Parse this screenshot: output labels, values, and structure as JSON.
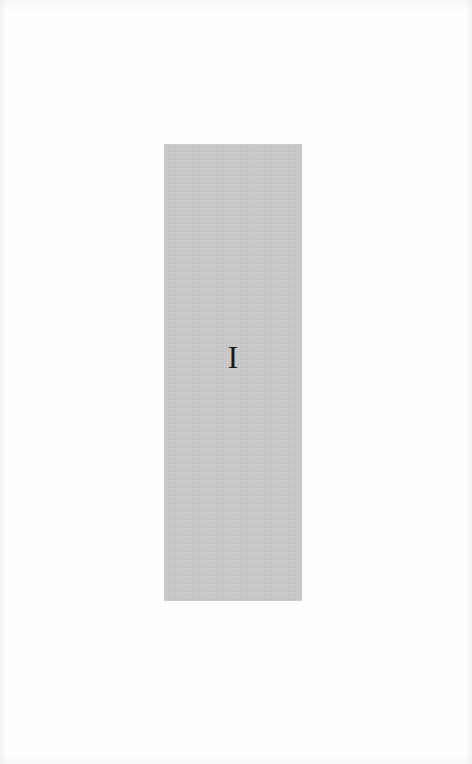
{
  "page": {
    "background_color": "#fefefe"
  },
  "plate": {
    "label": "I",
    "fill_color": "#cbcbcb",
    "text_color": "#1a1a1a"
  }
}
